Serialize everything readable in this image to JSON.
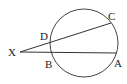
{
  "diagram": {
    "type": "circle-secants",
    "stroke_color": "#333333",
    "circle": {
      "cx": 84,
      "cy": 43,
      "r": 34
    },
    "external_point": {
      "label": "X",
      "x": 20,
      "y": 52
    },
    "secants": [
      {
        "from": "X",
        "near_point": "D",
        "far_point": "C"
      },
      {
        "from": "X",
        "near_point": "B",
        "far_point": "A"
      }
    ],
    "points": {
      "X": {
        "label": "X",
        "x": 20,
        "y": 52
      },
      "D": {
        "label": "D",
        "x": 51,
        "y": 43
      },
      "C": {
        "label": "C",
        "x": 111,
        "y": 23
      },
      "B": {
        "label": "B",
        "x": 51,
        "y": 52
      },
      "A": {
        "label": "A",
        "x": 117,
        "y": 53
      }
    }
  }
}
